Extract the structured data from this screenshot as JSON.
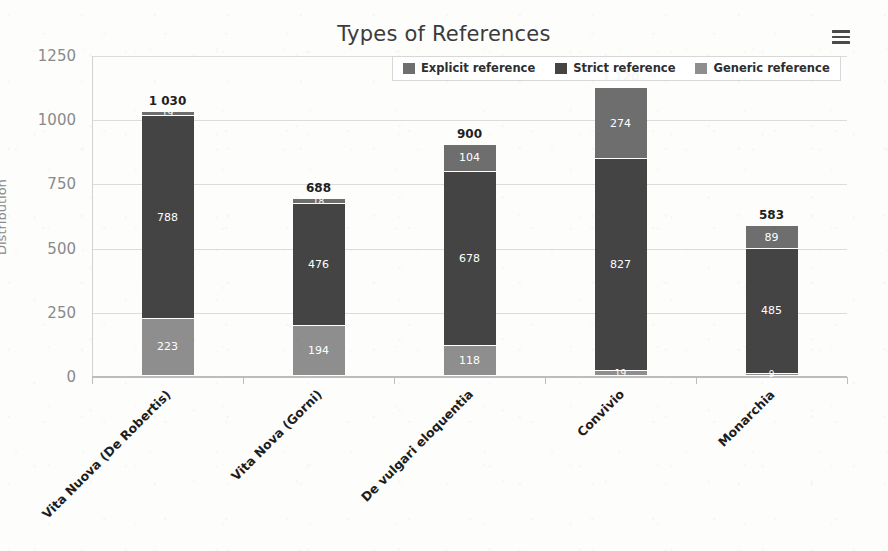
{
  "title": "Types of References",
  "menu_icon": "hamburger-menu-icon",
  "y_axis": {
    "label": "Distribution",
    "ticks": [
      "0",
      "250",
      "500",
      "750",
      "1000",
      "1250"
    ]
  },
  "legend": {
    "items": [
      {
        "label": "Explicit reference",
        "color": "#6e6e6e"
      },
      {
        "label": "Strict reference",
        "color": "#444444"
      },
      {
        "label": "Generic reference",
        "color": "#8e8e8e"
      }
    ]
  },
  "bars": [
    {
      "category": "Vita Nuova (De Robertis)",
      "total": "1 030",
      "segments": [
        {
          "series": "Generic reference",
          "label": "223",
          "value": 223
        },
        {
          "series": "Strict reference",
          "label": "788",
          "value": 788
        },
        {
          "series": "Explicit reference",
          "label": "19",
          "value": 19
        }
      ]
    },
    {
      "category": "Vita Nova (Gorni)",
      "total": "688",
      "segments": [
        {
          "series": "Generic reference",
          "label": "194",
          "value": 194
        },
        {
          "series": "Strict reference",
          "label": "476",
          "value": 476
        },
        {
          "series": "Explicit reference",
          "label": "18",
          "value": 18
        }
      ]
    },
    {
      "category": "De vulgari eloquentia",
      "total": "900",
      "segments": [
        {
          "series": "Generic reference",
          "label": "118",
          "value": 118
        },
        {
          "series": "Strict reference",
          "label": "678",
          "value": 678
        },
        {
          "series": "Explicit reference",
          "label": "104",
          "value": 104
        }
      ]
    },
    {
      "category": "Convivio",
      "total": "1 120",
      "segments": [
        {
          "series": "Generic reference",
          "label": "19",
          "value": 19
        },
        {
          "series": "Strict reference",
          "label": "827",
          "value": 827
        },
        {
          "series": "Explicit reference",
          "label": "274",
          "value": 274
        }
      ]
    },
    {
      "category": "Monarchia",
      "total": "583",
      "segments": [
        {
          "series": "Generic reference",
          "label": "9",
          "value": 9
        },
        {
          "series": "Strict reference",
          "label": "485",
          "value": 485
        },
        {
          "series": "Explicit reference",
          "label": "89",
          "value": 89
        }
      ]
    }
  ],
  "chart_data": {
    "type": "bar",
    "subtype": "stacked-bar",
    "title": "Types of References",
    "xlabel": "",
    "ylabel": "Distribution",
    "ylim": [
      0,
      1250
    ],
    "ytick_step": 250,
    "yticks": [
      0,
      250,
      500,
      750,
      1000,
      1250
    ],
    "grid": true,
    "legend_position": "top-center",
    "categories": [
      "Vita Nuova (De Robertis)",
      "Vita Nova (Gorni)",
      "De vulgari eloquentia",
      "Convivio",
      "Monarchia"
    ],
    "series": [
      {
        "name": "Generic reference",
        "color": "#8e8e8e",
        "stack_order": 0,
        "values": [
          223,
          194,
          118,
          19,
          9
        ]
      },
      {
        "name": "Strict reference",
        "color": "#444444",
        "stack_order": 1,
        "values": [
          788,
          476,
          678,
          827,
          485
        ]
      },
      {
        "name": "Explicit reference",
        "color": "#6e6e6e",
        "stack_order": 2,
        "values": [
          19,
          18,
          104,
          274,
          89
        ]
      }
    ],
    "totals": [
      1030,
      688,
      900,
      1120,
      583
    ],
    "total_labels": [
      "1 030",
      "688",
      "900",
      "1 120",
      "583"
    ]
  }
}
